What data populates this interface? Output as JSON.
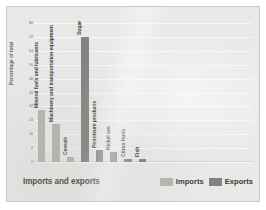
{
  "chart_data": {
    "type": "bar",
    "title": "",
    "xlabel": "Imports and exports",
    "ylabel": "Percentage of total",
    "ylim": [
      0,
      80
    ],
    "yticks": [
      0,
      8,
      16,
      24,
      32,
      40,
      48,
      56,
      64,
      72,
      80
    ],
    "grid": true,
    "legend_position": "bottom-right",
    "categories": [
      "Mineral fuels and lubricants",
      "Machinery and transportation equipment",
      "Cereals",
      "Sugar",
      "Petroleum products",
      "Nickel ore",
      "Citrus fruits",
      "Fish"
    ],
    "series": [
      {
        "name": "Imports",
        "color": "#b4b4b1",
        "values": [
          30,
          22,
          3,
          null,
          null,
          null,
          null,
          null
        ]
      },
      {
        "name": "Exports",
        "color": "#828280",
        "values": [
          null,
          null,
          null,
          72,
          7,
          6,
          2,
          2
        ]
      }
    ],
    "bars": [
      {
        "label": "Mineral fuels and lubricants",
        "value": 30,
        "series": "Imports"
      },
      {
        "label": "Machinery and transportation equipment",
        "value": 22,
        "series": "Imports"
      },
      {
        "label": "Cereals",
        "value": 3,
        "series": "Imports"
      },
      {
        "label": "Sugar",
        "value": 72,
        "series": "Exports"
      },
      {
        "label": "Petroleum products",
        "value": 7,
        "series": "Exports"
      },
      {
        "label": "Nickel ore",
        "value": 6,
        "series": "Exports"
      },
      {
        "label": "Citrus fruits",
        "value": 2,
        "series": "Exports"
      },
      {
        "label": "Fish",
        "value": 2,
        "series": "Exports"
      }
    ]
  },
  "legend": {
    "items": [
      {
        "label": "Imports",
        "color": "#b4b4b1"
      },
      {
        "label": "Exports",
        "color": "#828280"
      }
    ]
  }
}
